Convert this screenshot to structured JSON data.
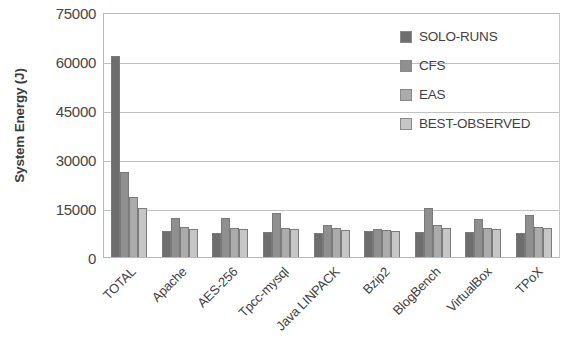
{
  "chart_data": {
    "type": "bar",
    "title": "",
    "xlabel": "",
    "ylabel": "System Energy (J)",
    "ylim": [
      0,
      75000
    ],
    "ytick_labels": [
      "75000",
      "60000",
      "45000",
      "30000",
      "15000",
      "0"
    ],
    "ytick_values": [
      75000,
      60000,
      45000,
      30000,
      15000,
      0
    ],
    "grid": true,
    "legend_position": "upper right inside plot",
    "categories": [
      "TOTAL",
      "Apache",
      "AES-256",
      "Tpcc-mysql",
      "Java LINPACK",
      "Bzip2",
      "BlogBench",
      "VirtualBox",
      "TPoX"
    ],
    "series": [
      {
        "name": "SOLO-RUNS",
        "color": "#6e6e6e",
        "values": [
          61500,
          7900,
          7500,
          7700,
          7400,
          8000,
          7700,
          7600,
          7500
        ]
      },
      {
        "name": "CFS",
        "color": "#8f8f8f",
        "values": [
          26000,
          11800,
          11800,
          13600,
          9800,
          8600,
          14900,
          11500,
          13000
        ]
      },
      {
        "name": "EAS",
        "color": "#ababab",
        "values": [
          18400,
          9100,
          9000,
          9000,
          9000,
          8300,
          9900,
          9000,
          9200
        ]
      },
      {
        "name": "BEST-OBSERVED",
        "color": "#c6c6c6",
        "values": [
          15000,
          8700,
          8700,
          8700,
          8400,
          8000,
          8800,
          8600,
          8800
        ]
      }
    ]
  }
}
